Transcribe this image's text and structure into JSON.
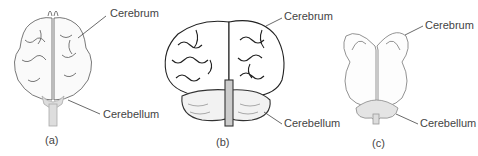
{
  "figure": {
    "panels": [
      {
        "id": "a",
        "caption": "(a)",
        "labels": {
          "top": "Cerebrum",
          "bottom": "Cerebellum"
        }
      },
      {
        "id": "b",
        "caption": "(b)",
        "labels": {
          "top": "Cerebrum",
          "bottom": "Cerebellum"
        }
      },
      {
        "id": "c",
        "caption": "(c)",
        "labels": {
          "top": "Cerebrum",
          "bottom": "Cerebellum"
        }
      }
    ]
  }
}
